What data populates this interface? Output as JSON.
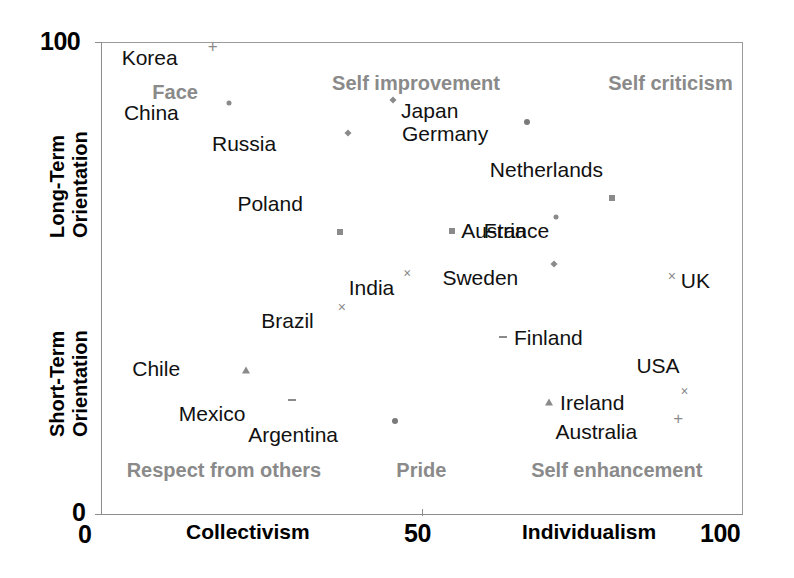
{
  "chart_data": {
    "type": "scatter",
    "title": "",
    "xlabel": "Collectivism / Individualism",
    "ylabel": "Short-Term Orientation / Long-Term Orientation",
    "xlim": [
      0,
      100
    ],
    "ylim": [
      0,
      100
    ],
    "grid": false,
    "legend": "none",
    "x_tick_labels": [
      "0",
      "50",
      "100"
    ],
    "x_tick_values": [
      0,
      50,
      100
    ],
    "y_tick_labels": [
      "0",
      "100"
    ],
    "y_tick_values": [
      0,
      100
    ],
    "axis_titles": {
      "x_left": "Collectivism",
      "x_right": "Individualism",
      "y_top_line1": "Long-Term",
      "y_top_line2": "Orientation",
      "y_bottom_line1": "Short-Term",
      "y_bottom_line2": "Orientation"
    },
    "quadrant_labels": [
      {
        "text": "Face",
        "x": 8,
        "y": 89,
        "align": "left"
      },
      {
        "text": "Self improvement",
        "x": 36,
        "y": 91,
        "align": "left"
      },
      {
        "text": "Self criticism",
        "x": 79,
        "y": 91,
        "align": "left"
      },
      {
        "text": "Respect from others",
        "x": 4,
        "y": 9,
        "align": "left"
      },
      {
        "text": "Pride",
        "x": 46,
        "y": 9,
        "align": "left"
      },
      {
        "text": "Self enhancement",
        "x": 67,
        "y": 9,
        "align": "left"
      }
    ],
    "points": [
      {
        "label": "Korea",
        "x": 17.4,
        "y": 99.2,
        "marker": "plus",
        "label_dx": -35,
        "label_dy": 12
      },
      {
        "label": "China",
        "x": 19.9,
        "y": 87.0,
        "marker": "dot",
        "label_dx": -50,
        "label_dy": 10
      },
      {
        "label": "Japan",
        "x": 45.5,
        "y": 87.7,
        "marker": "diamond",
        "label_dx": 8,
        "label_dy": 11
      },
      {
        "label": "Russia",
        "x": 38.5,
        "y": 80.8,
        "marker": "diamond",
        "label_dx": -72,
        "label_dy": 11
      },
      {
        "label": "Germany",
        "x": 66.4,
        "y": 83.1,
        "marker": "dot-lg",
        "label_dx": -39,
        "label_dy": 12
      },
      {
        "label": "Netherlands",
        "x": 79.6,
        "y": 67.0,
        "marker": "square",
        "label_dx": -9,
        "label_dy": -28
      },
      {
        "label": "Poland",
        "x": 37.2,
        "y": 59.8,
        "marker": "square",
        "label_dx": -37,
        "label_dy": -28
      },
      {
        "label": "Austria",
        "x": 54.7,
        "y": 60.0,
        "marker": "square",
        "label_dx": 9,
        "label_dy": 0
      },
      {
        "label": "France",
        "x": 70.9,
        "y": 63.0,
        "marker": "dot",
        "label_dx": -7,
        "label_dy": 14
      },
      {
        "label": "Sweden",
        "x": 70.6,
        "y": 53.1,
        "marker": "diamond",
        "label_dx": -36,
        "label_dy": 14
      },
      {
        "label": "India",
        "x": 47.7,
        "y": 51.0,
        "marker": "glyph-x",
        "label_dx": -13,
        "label_dy": 14
      },
      {
        "label": "UK",
        "x": 88.9,
        "y": 50.5,
        "marker": "x",
        "label_dx": 9,
        "label_dy": 5
      },
      {
        "label": "Brazil",
        "x": 37.5,
        "y": 44.0,
        "marker": "x",
        "label_dx": -28,
        "label_dy": 14
      },
      {
        "label": "Finland",
        "x": 62.6,
        "y": 37.6,
        "marker": "dash",
        "label_dx": 11,
        "label_dy": 1
      },
      {
        "label": "Chile",
        "x": 22.6,
        "y": 30.7,
        "marker": "triangle",
        "label_dx": -66,
        "label_dy": -1
      },
      {
        "label": "USA",
        "x": 90.9,
        "y": 26.0,
        "marker": "glyph-x",
        "label_dx": -5,
        "label_dy": -26
      },
      {
        "label": "Ireland",
        "x": 69.8,
        "y": 23.9,
        "marker": "triangle",
        "label_dx": 11,
        "label_dy": 1
      },
      {
        "label": "Mexico",
        "x": 29.8,
        "y": 24.3,
        "marker": "dash",
        "label_dx": -47,
        "label_dy": 14
      },
      {
        "label": "Australia",
        "x": 89.9,
        "y": 20.5,
        "marker": "plus",
        "label_dx": -41,
        "label_dy": 14
      },
      {
        "label": "Argentina",
        "x": 45.8,
        "y": 19.9,
        "marker": "dot-lg",
        "label_dx": -57,
        "label_dy": 14
      }
    ]
  },
  "colors": {
    "axis": "#8d8d8d",
    "marker": "#8a8a8a",
    "quadrant_label": "#8a8a8a",
    "country_label": "#111111",
    "background": "#ffffff"
  }
}
